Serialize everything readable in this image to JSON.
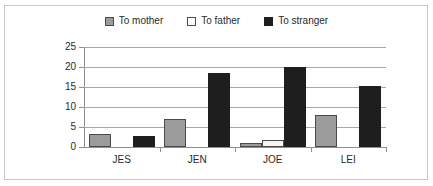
{
  "chart_data": {
    "type": "bar",
    "title": "",
    "subtitle": "",
    "xlabel": "",
    "ylabel": "",
    "ylim": [
      0,
      25
    ],
    "yticks": [
      0,
      5,
      10,
      15,
      20,
      25
    ],
    "grid": true,
    "legend_position": "top-center",
    "categories": [
      "JES",
      "JEN",
      "JOE",
      "LEI"
    ],
    "series": [
      {
        "name": "To mother",
        "color": "#9b9b9b",
        "swatch": "gray-square",
        "values": [
          3.2,
          6.9,
          1.1,
          8.0
        ]
      },
      {
        "name": "To father",
        "color": "#f7f7f0",
        "swatch": "white-square",
        "values": [
          0,
          0,
          1.7,
          0
        ]
      },
      {
        "name": "To stranger",
        "color": "#1e1e1e",
        "swatch": "black-square",
        "values": [
          2.8,
          18.5,
          20.0,
          15.3
        ]
      }
    ]
  },
  "legend": {
    "items": [
      {
        "label": "To mother"
      },
      {
        "label": "To father"
      },
      {
        "label": "To stranger"
      }
    ]
  },
  "axis": {
    "y_tick_labels": [
      "25",
      "20",
      "15",
      "10",
      "5",
      "0"
    ],
    "x_tick_labels": [
      "JES",
      "JEN",
      "JOE",
      "LEI"
    ]
  }
}
